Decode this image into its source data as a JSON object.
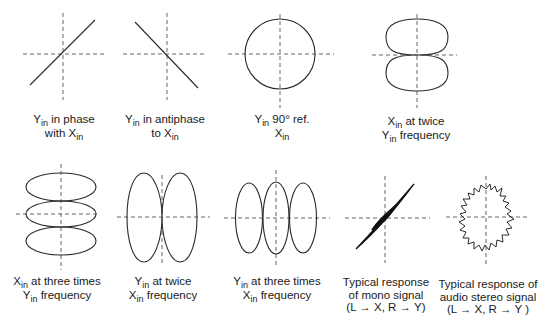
{
  "colors": {
    "stroke": "#2a2a2a",
    "axis": "#555555",
    "background": "#ffffff"
  },
  "figures": [
    {
      "id": "in-phase",
      "label_lines": [
        [
          "Y",
          "in",
          " in phase"
        ],
        [
          "with X",
          "in",
          ""
        ]
      ]
    },
    {
      "id": "antiphase",
      "label_lines": [
        [
          "Y",
          "in",
          " in antiphase"
        ],
        [
          "to X",
          "in",
          ""
        ]
      ]
    },
    {
      "id": "ninety-degree",
      "label_lines": [
        [
          "Y",
          "in",
          " 90° ref."
        ],
        [
          "X",
          "in",
          ""
        ]
      ]
    },
    {
      "id": "x-twice-y",
      "label_lines": [
        [
          "X",
          "in",
          " at twice"
        ],
        [
          "Y",
          "in",
          " frequency"
        ]
      ]
    },
    {
      "id": "x-three-times-y",
      "label_lines": [
        [
          "X",
          "in",
          " at three times"
        ],
        [
          "Y",
          "in",
          " frequency"
        ]
      ]
    },
    {
      "id": "y-twice-x",
      "label_lines": [
        [
          "Y",
          "in",
          " at twice"
        ],
        [
          "X",
          "in",
          " frequency"
        ]
      ]
    },
    {
      "id": "y-three-times-x",
      "label_lines": [
        [
          "Y",
          "in",
          " at three times"
        ],
        [
          "X",
          "in",
          " frequency"
        ]
      ]
    },
    {
      "id": "mono-signal",
      "label_lines": [
        [
          "Typical response",
          "",
          ""
        ],
        [
          "of mono signal",
          "",
          ""
        ],
        [
          "(L → X, R → Y)",
          "",
          ""
        ]
      ]
    },
    {
      "id": "stereo-signal",
      "label_lines": [
        [
          "Typical response of",
          "",
          ""
        ],
        [
          "audio stereo signal",
          "",
          ""
        ],
        [
          "(L → X, R → Y )",
          "",
          ""
        ]
      ]
    }
  ],
  "labels": {
    "f0_l1_main": "Y",
    "f0_l1_sub": "in",
    "f0_l1_rest": " in phase",
    "f0_l2_main": "with X",
    "f0_l2_sub": "in",
    "f1_l1_main": "Y",
    "f1_l1_sub": "in",
    "f1_l1_rest": " in antiphase",
    "f1_l2_main": "to X",
    "f1_l2_sub": "in",
    "f2_l1_main": "Y",
    "f2_l1_sub": "in",
    "f2_l1_rest": " 90° ref.",
    "f2_l2_main": "X",
    "f2_l2_sub": "in",
    "f3_l1_main": "X",
    "f3_l1_sub": "in",
    "f3_l1_rest": " at twice",
    "f3_l2_main": "Y",
    "f3_l2_sub": "in",
    "f3_l2_rest": " frequency",
    "f4_l1_main": "X",
    "f4_l1_sub": "in",
    "f4_l1_rest": " at three times",
    "f4_l2_main": "Y",
    "f4_l2_sub": "in",
    "f4_l2_rest": " frequency",
    "f5_l1_main": "Y",
    "f5_l1_sub": "in",
    "f5_l1_rest": " at twice",
    "f5_l2_main": "X",
    "f5_l2_sub": "in",
    "f5_l2_rest": " frequency",
    "f6_l1_main": "Y",
    "f6_l1_sub": "in",
    "f6_l1_rest": " at three times",
    "f6_l2_main": "X",
    "f6_l2_sub": "in",
    "f6_l2_rest": " frequency",
    "f7_l1": "Typical response",
    "f7_l2": "of mono signal",
    "f7_l3": "(L → X, R → Y)",
    "f8_l1": "Typical response of",
    "f8_l2": "audio stereo signal",
    "f8_l3": "(L → X, R → Y )"
  }
}
